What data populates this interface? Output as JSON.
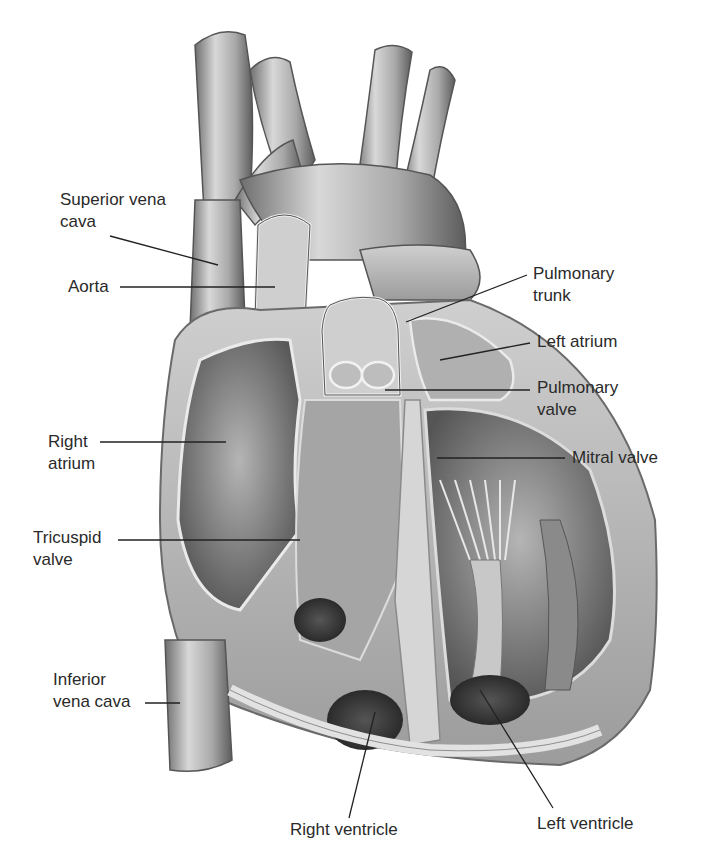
{
  "figure": {
    "style": "grayscale pencil illustration",
    "colors": {
      "background": "#ffffff",
      "label_text": "#2a2a2a",
      "leader_line": "#222222",
      "tissue_light": "#d9d9d9",
      "tissue_mid": "#a8a8a8",
      "tissue_dark": "#555555",
      "cavity_dark": "#3a3a3a"
    }
  },
  "labels": [
    {
      "id": "superior-vena-cava",
      "lines": [
        "Superior vena",
        "cava"
      ]
    },
    {
      "id": "aorta",
      "lines": [
        "Aorta"
      ]
    },
    {
      "id": "pulmonary-trunk",
      "lines": [
        "Pulmonary",
        "trunk"
      ]
    },
    {
      "id": "left-atrium",
      "lines": [
        "Left atrium"
      ]
    },
    {
      "id": "pulmonary-valve",
      "lines": [
        "Pulmonary",
        "valve"
      ]
    },
    {
      "id": "right-atrium",
      "lines": [
        "Right",
        "atrium"
      ]
    },
    {
      "id": "mitral-valve",
      "lines": [
        "Mitral valve"
      ]
    },
    {
      "id": "tricuspid-valve",
      "lines": [
        "Tricuspid",
        "valve"
      ]
    },
    {
      "id": "inferior-vena-cava",
      "lines": [
        "Inferior",
        "vena cava"
      ]
    },
    {
      "id": "right-ventricle",
      "lines": [
        "Right ventricle"
      ]
    },
    {
      "id": "left-ventricle",
      "lines": [
        "Left ventricle"
      ]
    }
  ]
}
